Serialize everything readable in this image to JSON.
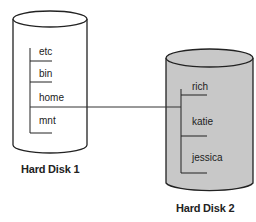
{
  "diagram": {
    "type": "filesystem-mount",
    "disks": [
      {
        "name": "Hard Disk 1",
        "fill": "#ffffff",
        "directories": [
          "etc",
          "bin",
          "home",
          "mnt"
        ]
      },
      {
        "name": "Hard Disk 2",
        "fill": "#c8c8c8",
        "directories": [
          "rich",
          "katie",
          "jessica"
        ]
      }
    ],
    "connection": {
      "from": "home",
      "to": "Hard Disk 2 root"
    }
  }
}
